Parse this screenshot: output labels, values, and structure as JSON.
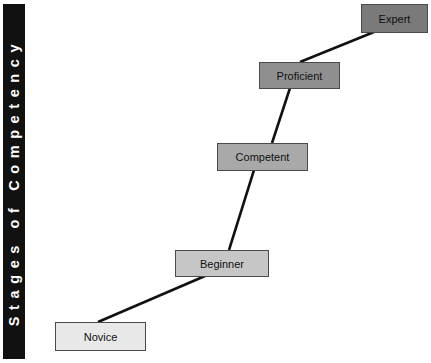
{
  "sidebar": {
    "title": "Stages of Competency",
    "color": "#111111"
  },
  "stages": [
    {
      "label": "Novice",
      "fill": "#e8e8e8"
    },
    {
      "label": "Beginner",
      "fill": "#c6c6c6"
    },
    {
      "label": "Competent",
      "fill": "#a9a9a9"
    },
    {
      "label": "Proficient",
      "fill": "#8f8f8f"
    },
    {
      "label": "Expert",
      "fill": "#7a7a7a"
    }
  ],
  "connector_color": "#111111"
}
